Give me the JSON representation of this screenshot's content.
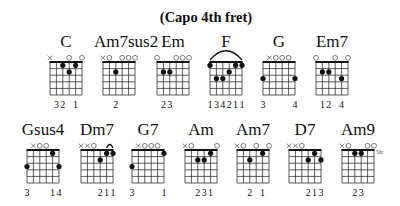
{
  "title": "(Capo 4th fret)",
  "chords": [
    {
      "name": "C",
      "x": 41,
      "y": 33,
      "top": [
        "x",
        "",
        "",
        "o",
        "",
        "o"
      ],
      "barre": null,
      "dots": [
        [
          1,
          2
        ],
        [
          2,
          3
        ],
        [
          1,
          4
        ]
      ],
      "fret_label": "",
      "fingers": [
        "",
        "3",
        "2",
        "",
        "1",
        ""
      ]
    },
    {
      "name": "Am7sus2",
      "x": 94,
      "y": 33,
      "top": [
        "x",
        "o",
        "",
        "o",
        "o",
        "o"
      ],
      "barre": null,
      "dots": [
        [
          2,
          2
        ]
      ],
      "fret_label": "",
      "fingers": [
        "",
        "",
        "2",
        "",
        "",
        ""
      ]
    },
    {
      "name": "Em",
      "x": 148,
      "y": 33,
      "top": [
        "o",
        "",
        "",
        "o",
        "o",
        "o"
      ],
      "barre": null,
      "dots": [
        [
          2,
          1
        ],
        [
          2,
          2
        ]
      ],
      "fret_label": "",
      "fingers": [
        "",
        "2",
        "3",
        "",
        "",
        ""
      ]
    },
    {
      "name": "F",
      "x": 201,
      "y": 33,
      "top": [
        "",
        "",
        "",
        "",
        "",
        ""
      ],
      "barre": {
        "fret": 1,
        "arc": [
          0,
          5
        ]
      },
      "dots": [
        [
          1,
          0
        ],
        [
          3,
          1
        ],
        [
          3,
          2
        ],
        [
          2,
          3
        ],
        [
          1,
          4
        ],
        [
          1,
          5
        ]
      ],
      "fret_label": "",
      "fingers": [
        "1",
        "3",
        "4",
        "2",
        "1",
        "1"
      ]
    },
    {
      "name": "G",
      "x": 254,
      "y": 33,
      "top": [
        "",
        "x",
        "o",
        "o",
        "o",
        ""
      ],
      "barre": null,
      "dots": [
        [
          3,
          0
        ],
        [
          3,
          5
        ]
      ],
      "fret_label": "",
      "fingers": [
        "3",
        "",
        "",
        "",
        "",
        "4"
      ]
    },
    {
      "name": "Em7",
      "x": 307,
      "y": 33,
      "top": [
        "o",
        "",
        "",
        "o",
        "",
        "o"
      ],
      "barre": null,
      "dots": [
        [
          2,
          1
        ],
        [
          2,
          2
        ],
        [
          3,
          4
        ]
      ],
      "fret_label": "",
      "fingers": [
        "",
        "1",
        "2",
        "",
        "4",
        ""
      ]
    },
    {
      "name": "Gsus4",
      "x": 18,
      "y": 121,
      "top": [
        "",
        "x",
        "o",
        "o",
        "",
        ""
      ],
      "barre": null,
      "dots": [
        [
          3,
          0
        ],
        [
          1,
          4
        ],
        [
          3,
          5
        ]
      ],
      "fret_label": "",
      "fingers": [
        "3",
        "",
        "",
        "",
        "1",
        "4"
      ]
    },
    {
      "name": "Dm7",
      "x": 72,
      "y": 121,
      "top": [
        "x",
        "x",
        "o",
        "",
        "",
        ""
      ],
      "barre": {
        "fret": 1,
        "arc": [
          4,
          5
        ]
      },
      "dots": [
        [
          2,
          3
        ],
        [
          1,
          4
        ],
        [
          1,
          5
        ]
      ],
      "fret_label": "",
      "fingers": [
        "",
        "",
        "",
        "2",
        "1",
        "1"
      ]
    },
    {
      "name": "G7",
      "x": 123,
      "y": 121,
      "top": [
        "",
        "x",
        "o",
        "o",
        "o",
        ""
      ],
      "barre": null,
      "dots": [
        [
          3,
          0
        ],
        [
          1,
          5
        ]
      ],
      "fret_label": "",
      "fingers": [
        "3",
        "",
        "",
        "",
        "",
        "1"
      ]
    },
    {
      "name": "Am",
      "x": 176,
      "y": 121,
      "top": [
        "x",
        "o",
        "",
        "",
        "",
        "o"
      ],
      "barre": null,
      "dots": [
        [
          2,
          2
        ],
        [
          2,
          3
        ],
        [
          1,
          4
        ]
      ],
      "fret_label": "",
      "fingers": [
        "",
        "",
        "2",
        "3",
        "1",
        ""
      ]
    },
    {
      "name": "Am7",
      "x": 228,
      "y": 121,
      "top": [
        "x",
        "o",
        "",
        "o",
        "",
        "o"
      ],
      "barre": null,
      "dots": [
        [
          2,
          2
        ],
        [
          1,
          4
        ]
      ],
      "fret_label": "",
      "fingers": [
        "",
        "",
        "2",
        "",
        "1",
        ""
      ]
    },
    {
      "name": "D7",
      "x": 280,
      "y": 121,
      "top": [
        "x",
        "x",
        "o",
        "",
        "",
        ""
      ],
      "barre": null,
      "dots": [
        [
          2,
          3
        ],
        [
          1,
          4
        ],
        [
          2,
          5
        ]
      ],
      "fret_label": "",
      "fingers": [
        "",
        "",
        "",
        "2",
        "1",
        "3"
      ]
    },
    {
      "name": "Am9",
      "x": 333,
      "y": 121,
      "top": [
        "x",
        "o",
        "",
        "",
        "o",
        "o"
      ],
      "barre": null,
      "dots": [
        [
          1,
          2
        ],
        [
          1,
          3
        ]
      ],
      "fret_label": "5fr",
      "fingers": [
        "",
        "",
        "2",
        "3",
        "",
        ""
      ]
    }
  ]
}
